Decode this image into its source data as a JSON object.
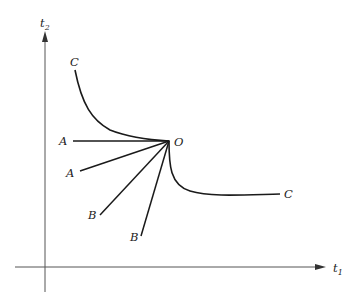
{
  "diagram": {
    "axes": {
      "x_label": "t",
      "x_subscript": "1",
      "y_label": "t",
      "y_subscript": "2"
    },
    "origin_point_label": "O",
    "curve_labels": {
      "c_top": "C",
      "c_right": "C"
    },
    "ray_labels": {
      "a_horizontal": "A",
      "a_lower": "A",
      "b_left": "B",
      "b_right": "B"
    }
  }
}
